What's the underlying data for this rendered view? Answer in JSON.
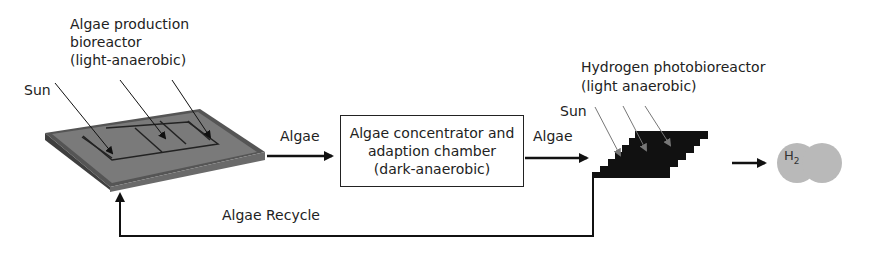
{
  "diagram": {
    "bioreactor_label": [
      "Algae production",
      "bioreactor",
      "(light-anaerobic)"
    ],
    "sun_left": "Sun",
    "arrow1_label": "Algae",
    "concentrator_label": [
      "Algae concentrator and",
      "adaption chamber",
      "(dark-anaerobic)"
    ],
    "arrow2_label": "Algae",
    "photobioreactor_label": [
      "Hydrogen photobioreactor",
      "(light anaerobic)"
    ],
    "sun_right": "Sun",
    "product": {
      "symbol": "H",
      "subscript": "2"
    },
    "recycle_label": "Algae Recycle",
    "colors": {
      "tray": "#6e6e6e",
      "tray_dark": "#4a4a4a",
      "staircase": "#111111",
      "h2_bubble": "#b9b9b9",
      "line": "#111111"
    }
  }
}
